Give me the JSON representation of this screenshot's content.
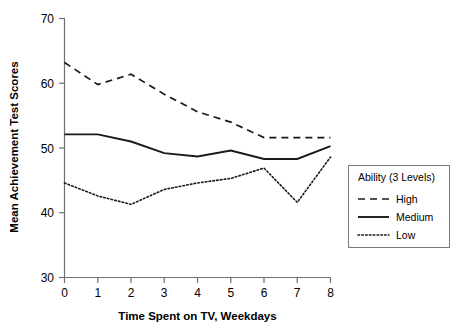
{
  "chart_data": {
    "type": "line",
    "title": "",
    "xlabel": "Time Spent on TV, Weekdays",
    "ylabel": "Mean Achievement Test Scores",
    "x": [
      0,
      1,
      2,
      3,
      4,
      5,
      6,
      7,
      8
    ],
    "xticks": [
      "0",
      "1",
      "2",
      "3",
      "4",
      "5",
      "6",
      "7",
      "8"
    ],
    "yticks": [
      "30",
      "40",
      "50",
      "60",
      "70"
    ],
    "ytick_values": [
      30,
      40,
      50,
      60,
      70
    ],
    "xlim": [
      0,
      8
    ],
    "ylim": [
      30,
      70
    ],
    "grid": false,
    "legend_position": "right",
    "legend_title": "Ability (3 Levels)",
    "series": [
      {
        "name": "High",
        "style": "dashed",
        "values": [
          63.2,
          59.8,
          61.4,
          58.3,
          55.6,
          54.0,
          51.6,
          51.6,
          51.6
        ]
      },
      {
        "name": "Medium",
        "style": "solid",
        "values": [
          52.1,
          52.1,
          51.0,
          49.2,
          48.7,
          49.6,
          48.3,
          48.3,
          50.3
        ]
      },
      {
        "name": "Low",
        "style": "dotted",
        "values": [
          44.6,
          42.6,
          41.3,
          43.6,
          44.6,
          45.3,
          46.9,
          41.6,
          48.6
        ]
      }
    ]
  },
  "legend": {
    "title": "Ability (3 Levels)",
    "entries": [
      {
        "label": "High",
        "style": "dashed"
      },
      {
        "label": "Medium",
        "style": "solid"
      },
      {
        "label": "Low",
        "style": "dotted"
      }
    ]
  },
  "axes": {
    "x_title": "Time Spent on TV, Weekdays",
    "y_title": "Mean Achievement Test Scores"
  },
  "colors": {
    "line": "#1a1a1a",
    "axis": "#6f6f6f",
    "legend_border": "#7a7a7a",
    "background": "#ffffff"
  }
}
